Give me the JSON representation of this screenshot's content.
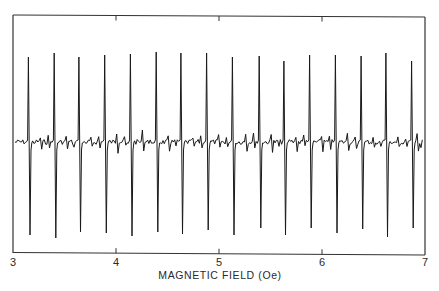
{
  "chart_data": {
    "type": "line",
    "title": "",
    "xlabel": "MAGNETIC FIELD (Oe)",
    "ylabel": "",
    "xlim": [
      3,
      7
    ],
    "ylim": [
      -100,
      100
    ],
    "x_ticks": [
      3,
      4,
      5,
      6,
      7
    ],
    "x_tick_labels": [
      "3",
      "4",
      "5",
      "6",
      "7"
    ],
    "y_ticks": [],
    "grid": false,
    "legend": null,
    "series": [
      {
        "name": "signal",
        "peaks": {
          "field_Oe": [
            3.15,
            3.4,
            3.64,
            3.89,
            4.14,
            4.39,
            4.63,
            4.88,
            5.13,
            5.39,
            5.63,
            5.88,
            6.13,
            6.38,
            6.62,
            6.87
          ],
          "positive_amplitude": [
            85,
            89,
            85,
            87,
            88,
            90,
            89,
            89,
            85,
            86,
            81,
            87,
            87,
            86,
            89,
            81
          ],
          "negative_amplitude": [
            -93,
            -96,
            -90,
            -91,
            -94,
            -90,
            -92,
            -88,
            -93,
            -86,
            -93,
            -86,
            -91,
            -87,
            -95,
            -86
          ]
        },
        "baseline": 0,
        "noise_amplitude": 5,
        "spacing_Oe": 0.248
      }
    ]
  },
  "colors": {
    "line": "#1a1a1a",
    "axis": "#333333",
    "background": "#ffffff"
  }
}
